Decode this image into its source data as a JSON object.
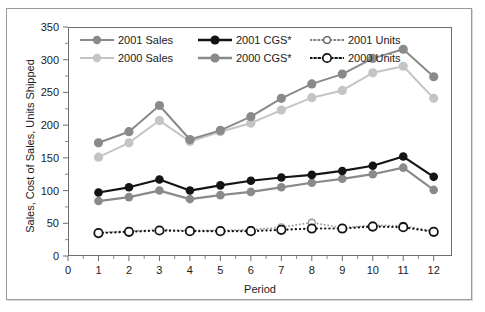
{
  "chart_data": {
    "type": "line",
    "title": "",
    "xlabel": "Period",
    "ylabel": "Sales, Cost of Sales, Units Shipped",
    "xlim": [
      0,
      12.6
    ],
    "ylim": [
      0,
      350
    ],
    "grid": false,
    "legend_position": "top-left-inside",
    "x": [
      1,
      2,
      3,
      4,
      5,
      6,
      7,
      8,
      9,
      10,
      11,
      12
    ],
    "xticks": [
      "0",
      "1",
      "2",
      "3",
      "4",
      "5",
      "6",
      "7",
      "8",
      "9",
      "10",
      "11",
      "12"
    ],
    "yticks": [
      "0",
      "50",
      "100",
      "150",
      "200",
      "250",
      "300",
      "350"
    ],
    "series": [
      {
        "name": "2001 Sales",
        "color": "#8a8a8a",
        "style": "solid",
        "marker": "filled-circle",
        "values": [
          173,
          190,
          230,
          178,
          192,
          213,
          241,
          263,
          278,
          302,
          316,
          274
        ]
      },
      {
        "name": "2000 Sales",
        "color": "#c4c4c4",
        "style": "solid",
        "marker": "filled-circle",
        "values": [
          151,
          173,
          207,
          175,
          190,
          203,
          223,
          242,
          253,
          280,
          290,
          241
        ]
      },
      {
        "name": "2001 CGS*",
        "color": "#141414",
        "style": "solid",
        "marker": "filled-circle",
        "values": [
          97,
          105,
          117,
          100,
          108,
          115,
          120,
          124,
          130,
          138,
          152,
          121
        ]
      },
      {
        "name": "2000 CGS*",
        "color": "#8a8a8a",
        "style": "solid",
        "marker": "filled-circle",
        "values": [
          84,
          90,
          100,
          87,
          93,
          98,
          105,
          112,
          118,
          125,
          135,
          101
        ]
      },
      {
        "name": "2001 Units",
        "color": "#9a9a9a",
        "style": "dotted",
        "marker": "open-circle-small",
        "values": [
          36,
          38,
          40,
          39,
          39,
          40,
          44,
          51,
          43,
          47,
          46,
          38
        ]
      },
      {
        "name": "2000 Units",
        "color": "#141414",
        "style": "dotted",
        "marker": "open-circle-large",
        "values": [
          35,
          37,
          39,
          38,
          38,
          38,
          40,
          42,
          42,
          45,
          44,
          37
        ]
      }
    ]
  },
  "legend": {
    "rows": [
      [
        "2001 Sales",
        "2001 CGS*",
        "2001 Units"
      ],
      [
        "2000 Sales",
        "2000 CGS*",
        "2000 Units"
      ]
    ]
  },
  "axes": {
    "y_title": "Sales, Cost of Sales, Units Shipped",
    "x_title": "Period"
  }
}
